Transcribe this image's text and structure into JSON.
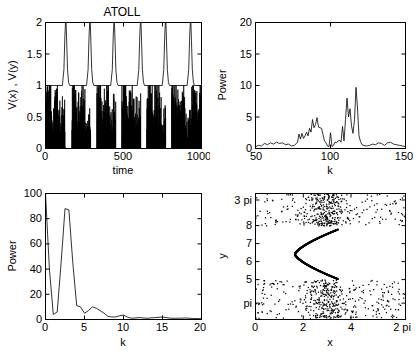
{
  "figure": {
    "title": "ATOLL",
    "background": "#ffffff",
    "line_color": "#000000"
  },
  "chart_data": [
    {
      "id": "timeseries",
      "type": "line",
      "title": "ATOLL",
      "xlabel": "time",
      "ylabel": "V(x) , V(y)",
      "xlim": [
        0,
        1000
      ],
      "ylim": [
        0,
        2
      ],
      "xticks": [
        0,
        500,
        1000
      ],
      "xticklabels": [
        "0",
        "500",
        "1000"
      ],
      "yticks": [
        0,
        0.5,
        1,
        1.5,
        2
      ],
      "yticklabels": [
        "0",
        "0.5",
        "1",
        "1.5",
        "2"
      ],
      "grid": false,
      "legend": "none",
      "series": [
        {
          "name": "V(y)",
          "description": "periodic spiking trace oscillating between baseline 1 and peak 2 with period about 155 time units",
          "baseline": 1,
          "peak": 2,
          "period": 155,
          "spike_times": [
            130,
            285,
            440,
            610,
            770,
            930
          ],
          "spike_width": 40
        },
        {
          "name": "V(x)",
          "description": "chaotic bursting trace confined between 0 and 1, dense noisy bursts separated by quiet gaps",
          "min": 0,
          "max": 1,
          "burst_starts": [
            5,
            170,
            330,
            490,
            650,
            810,
            935
          ],
          "burst_length": 120
        }
      ]
    },
    {
      "id": "power-spectrum-k50-150",
      "type": "line",
      "title": "",
      "xlabel": "k",
      "ylabel": "Power",
      "xlim": [
        50,
        150
      ],
      "ylim": [
        0,
        20
      ],
      "xticks": [
        50,
        100,
        150
      ],
      "xticklabels": [
        "50",
        "100",
        "150"
      ],
      "yticks": [
        0,
        5,
        10,
        15,
        20
      ],
      "yticklabels": [
        "0",
        "5",
        "10",
        "15",
        "20"
      ],
      "grid": false,
      "x": [
        50,
        52,
        54,
        56,
        58,
        60,
        62,
        64,
        66,
        68,
        70,
        72,
        74,
        76,
        78,
        79,
        80,
        81,
        82,
        83,
        84,
        85,
        86,
        87,
        88,
        89,
        90,
        91,
        92,
        93,
        94,
        95,
        96,
        97,
        98,
        99,
        100,
        101,
        102,
        103,
        104,
        105,
        106,
        107,
        108,
        109,
        110,
        111,
        112,
        113,
        114,
        115,
        116,
        117,
        118,
        119,
        120,
        121,
        122,
        124,
        126,
        128,
        130,
        132,
        134,
        136,
        138,
        140,
        142,
        144,
        146,
        148,
        150
      ],
      "values": [
        0.3,
        0.5,
        0.4,
        0.8,
        0.6,
        0.9,
        0.7,
        1.0,
        0.8,
        0.9,
        0.6,
        0.7,
        0.4,
        0.5,
        1.0,
        2.3,
        1.5,
        2.4,
        1.6,
        2.0,
        2.6,
        2.0,
        3.2,
        2.6,
        4.6,
        3.3,
        3.8,
        4.9,
        3.4,
        3.3,
        3.2,
        2.2,
        1.2,
        0.9,
        0.4,
        0.3,
        2.5,
        0.3,
        0.5,
        1.0,
        0.9,
        1.2,
        1.3,
        1.0,
        3.5,
        1.2,
        4.6,
        8.0,
        5.0,
        6.3,
        3.6,
        2.4,
        4.6,
        9.7,
        6.4,
        2.0,
        1.1,
        0.6,
        0.5,
        0.4,
        0.5,
        0.7,
        0.6,
        0.9,
        0.8,
        0.5,
        0.9,
        1.0,
        0.7,
        0.6,
        0.5,
        0.4,
        0.3
      ],
      "peaks": [
        {
          "k": 117,
          "power": 9.7
        },
        {
          "k": 111,
          "power": 8.0
        },
        {
          "k": 113,
          "power": 6.3
        },
        {
          "k": 118,
          "power": 6.4
        },
        {
          "k": 91,
          "power": 4.9
        },
        {
          "k": 88,
          "power": 4.6
        },
        {
          "k": 110,
          "power": 4.6
        }
      ]
    },
    {
      "id": "power-spectrum-k0-20",
      "type": "line",
      "title": "",
      "xlabel": "k",
      "ylabel": "Power",
      "xlim": [
        0,
        20
      ],
      "ylim": [
        0,
        100
      ],
      "xticks": [
        0,
        5,
        10,
        15,
        20
      ],
      "xticklabels": [
        "0",
        "5",
        "10",
        "15",
        "20"
      ],
      "yticks": [
        0,
        20,
        40,
        60,
        80,
        100
      ],
      "yticklabels": [
        "0",
        "20",
        "40",
        "60",
        "80",
        "100"
      ],
      "grid": false,
      "x": [
        0,
        0.5,
        1,
        1.5,
        2,
        2.5,
        3,
        3.5,
        4,
        4.5,
        5,
        5.5,
        6,
        6.5,
        7,
        7.5,
        8,
        8.5,
        9,
        9.5,
        10,
        10.5,
        11,
        12,
        13,
        14,
        15,
        16,
        17,
        18,
        19,
        20
      ],
      "values": [
        100,
        40,
        4,
        6,
        45,
        88,
        87,
        45,
        11,
        10,
        5,
        7,
        10,
        9,
        7,
        5,
        2.5,
        2,
        2,
        3,
        3.5,
        2,
        1,
        1.5,
        1,
        1.5,
        2,
        1,
        1,
        1.2,
        0.8,
        0.6
      ],
      "peaks": [
        {
          "k": 0,
          "power": 100
        },
        {
          "k": 3,
          "power": 87
        },
        {
          "k": 6,
          "power": 10
        }
      ],
      "note": "DC component at k=0 is clipped at the top of the axis"
    },
    {
      "id": "phase-scatter",
      "type": "scatter",
      "title": "",
      "xlabel": "x",
      "ylabel": "y",
      "xlim": [
        0,
        6.283185
      ],
      "ylim": [
        2.8,
        9.8
      ],
      "xticks": [
        0,
        2,
        4,
        6.283185
      ],
      "xticklabels": [
        "0",
        "2",
        "4",
        "2 pi"
      ],
      "yticks": [
        9.42,
        8,
        7,
        6,
        5,
        3.1416
      ],
      "yticklabels": [
        "3 pi",
        "8",
        "7",
        "6",
        "5",
        "pi"
      ],
      "grid": false,
      "n_points": 900,
      "description": "Two dense clouds of scattered points, one above y = 8 and one below y = 5, plus a sharply defined dense backwards-C shaped curve between y = 5 and y = 7.8 centred near x = 1.7 to 3.4",
      "curve": {
        "name": "invariant-curve",
        "shape": "backwards-C",
        "x_range": [
          1.65,
          3.45
        ],
        "y_range": [
          5.05,
          7.8
        ],
        "apex_x": 1.65,
        "apex_y": 6.4
      },
      "clouds": [
        {
          "name": "upper-cloud",
          "y_range": [
            8.0,
            9.8
          ],
          "x_range": [
            0,
            6.283
          ],
          "density_peak_x": 3.0
        },
        {
          "name": "lower-cloud",
          "y_range": [
            2.85,
            5.0
          ],
          "x_range": [
            0,
            6.283
          ],
          "density_peak_x": 3.0
        }
      ]
    }
  ]
}
